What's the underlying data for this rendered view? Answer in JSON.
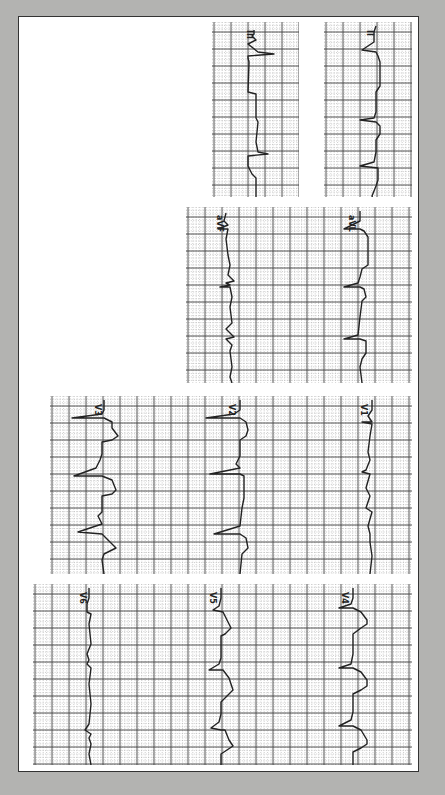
{
  "figure": {
    "background_color": "#b3b3b1",
    "paper_color": "#ffffff",
    "grid_major_color": "#444444",
    "grid_minor_color": "#9a9a9a",
    "trace_color": "#222222",
    "grid_major_px": 17
  },
  "strips": [
    {
      "id": "strip-iii",
      "x": 212,
      "y": 22,
      "w": 87,
      "h": 175,
      "leads": [
        {
          "label": "III",
          "x": 44,
          "points": "42,8 42,12 40,14 44,18 36,22 46,30 62,32 36,34 36,36 37,40 36,70 44,72 44,96 46,100 44,120 46,130 56,132 36,134 36,144 40,152 44,156 44,178 46,186 44,190 48,196 56,200 46,204 20,204 36,208 36,212"
        }
      ]
    },
    {
      "id": "strip-ii",
      "x": 324,
      "y": 22,
      "w": 88,
      "h": 175,
      "leads": [
        {
          "label": "II",
          "x": 52,
          "points": "52,4 50,10 50,20 38,28 52,30 54,34 56,40 56,64 52,70 52,90 50,96 36,98 52,100 56,104 56,112 52,118 52,130 50,140 36,144 54,146 54,158 52,164 48,174 50,180 48,186 50,188"
        }
      ]
    },
    {
      "id": "strip-limb-2",
      "x": 186,
      "y": 207,
      "w": 226,
      "h": 176,
      "leads": [
        {
          "label": "aVF",
          "x": 40,
          "points": "40,6 38,14 42,18 32,22 42,22 40,32 42,48 44,58 42,68 48,74 40,76 44,78 34,80 44,80 46,90 44,100 46,116 40,122 48,130 40,132 46,138 44,144 46,160 44,170 46,176"
        },
        {
          "label": "aVL",
          "x": 172,
          "points": "174,4 174,14 170,16 158,22 174,22 178,24 182,30 182,58 176,62 174,70 172,76 158,80 174,80 178,82 180,90 176,94 174,110 172,128 158,132 174,132 180,134 180,146 176,152 174,160 176,176"
        }
      ]
    },
    {
      "id": "strip-precordial-1",
      "x": 50,
      "y": 396,
      "w": 362,
      "h": 178,
      "leads": [
        {
          "label": "V3",
          "x": 54,
          "points": "54,4 54,14 52,18 22,22 54,22 62,26 62,32 68,40 62,44 52,46 52,58 50,64 46,72 24,80 52,80 62,84 66,94 62,98 52,100 52,116 48,120 52,128 28,136 52,138 58,144 66,152 62,154 54,158 52,164 54,178"
        },
        {
          "label": "V2",
          "x": 188,
          "points": "190,4 190,14 184,18 156,22 190,22 196,26 198,34 196,40 190,44 190,60 186,68 190,72 160,78 190,78 194,80 194,102 192,112 190,130 164,138 190,138 196,142 198,152 192,158 190,178"
        },
        {
          "label": "V1",
          "x": 320,
          "points": "322,4 322,14 318,20 322,26 312,26 322,28 320,40 318,56 320,64 316,74 312,76 320,78 316,92 320,100 316,112 322,116 318,130 320,138 320,146 322,160 320,178"
        }
      ]
    },
    {
      "id": "strip-precordial-2",
      "x": 33,
      "y": 584,
      "w": 379,
      "h": 181,
      "leads": [
        {
          "label": "V6",
          "x": 56,
          "points": "56,4 56,14 54,20 54,28 58,30 56,40 58,60 54,70 56,76 54,80 58,84 56,100 58,120 56,140 52,146 58,150 56,154 58,160 56,170 58,181"
        },
        {
          "label": "V5",
          "x": 186,
          "points": "188,4 188,14 186,22 180,26 190,28 194,36 198,44 192,50 188,52 188,74 186,80 176,86 190,86 196,94 200,106 194,112 188,118 188,130 186,138 178,144 188,146 192,146 196,156 200,162 194,166 188,170 188,181"
        },
        {
          "label": "V4",
          "x": 318,
          "points": "320,4 320,14 318,20 306,24 320,24 328,28 334,36 334,40 328,44 320,50 320,70 318,80 306,84 320,84 328,88 334,96 334,102 328,106 320,110 320,128 318,136 306,142 320,142 328,146 334,156 334,160 328,164 320,168 320,181"
        }
      ]
    }
  ]
}
